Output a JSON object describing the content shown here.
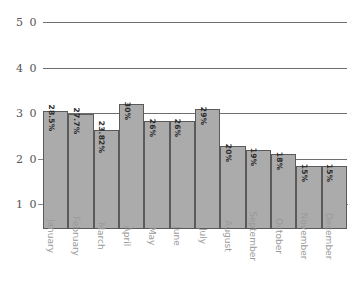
{
  "chart_data": {
    "type": "bar",
    "title": "",
    "subtitle": "",
    "xlabel": "",
    "ylabel": "",
    "categories": [
      "January",
      "February",
      "March",
      "April",
      "May",
      "June",
      "July",
      "August",
      "September",
      "October",
      "November",
      "December"
    ],
    "values": [
      28.5,
      27.7,
      23.82,
      30,
      26,
      26,
      29,
      20,
      19,
      18,
      15,
      15
    ],
    "data_labels": [
      "28.5%",
      "27.7%",
      "23.82%",
      "30%",
      "26%",
      "26%",
      "29%",
      "20%",
      "19%",
      "18%",
      "15%",
      "15%"
    ],
    "series": [
      {
        "name": "",
        "values": [
          28.5,
          27.7,
          23.82,
          30,
          26,
          26,
          29,
          20,
          19,
          18,
          15,
          15
        ]
      }
    ],
    "ylim": [
      0,
      50
    ],
    "y_ticks": [
      10,
      20,
      30,
      40,
      50
    ],
    "y_tick_labels": [
      "1 0",
      "2 0",
      "3 0",
      "4 0",
      "5 0"
    ],
    "grid": true,
    "legend": false,
    "legend_position": "none",
    "orientation": "vertical",
    "colors": {
      "bar_fill": "#ababab",
      "bar_border": "#5a5a5a",
      "gridline": "#6e6e6e",
      "axis_text": "#555555",
      "category_text": "#9a9a9a",
      "value_text": "#2b2b2b",
      "background": "#ffffff"
    }
  }
}
